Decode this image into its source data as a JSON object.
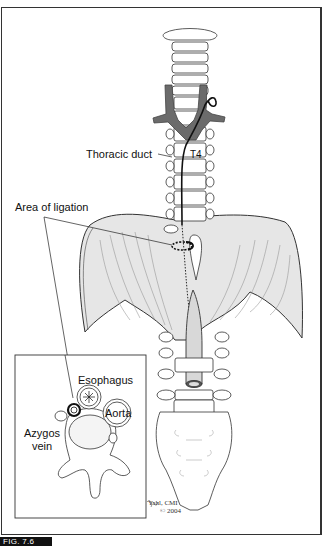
{
  "figure": {
    "label": "FIG. 7.6"
  },
  "labels": {
    "thoracic_duct": "Thoracic duct",
    "t4": "T4",
    "area_of_ligation": "Area of ligation",
    "esophagus": "Esophagus",
    "aorta": "Aorta",
    "azygos_vein_line1": "Azygos",
    "azygos_vein_line2": "vein"
  },
  "signature": {
    "artist": "Yahl, CMI",
    "copyright": "© 2004"
  },
  "colors": {
    "line": "#333333",
    "vein_fill": "#6b6b6b",
    "diaphragm_fill": "#e6e6e6",
    "duct": "#111111",
    "label_bg": "#111111"
  }
}
